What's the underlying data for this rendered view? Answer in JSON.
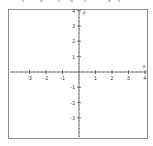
{
  "chart_data": {
    "type": "line",
    "title": "",
    "xlabel": "x",
    "ylabel": "y",
    "xlim": [
      -4,
      4
    ],
    "ylim": [
      -4,
      4
    ],
    "x_ticks": [
      -3,
      -2,
      -1,
      1,
      2,
      3,
      4
    ],
    "y_ticks": [
      4,
      3,
      2,
      1,
      -1,
      -2,
      -3
    ],
    "x_tick_labels": [
      "-3",
      "-2",
      "-1",
      "1",
      "2",
      "3",
      "4"
    ],
    "y_tick_labels": [
      "4",
      "3",
      "2",
      "1",
      "-1",
      "-2",
      "-3"
    ],
    "minor_ticks_per_unit": 4,
    "grid": false,
    "series": []
  },
  "colors": {
    "axis": "#555555",
    "frame": "#8a8a8a",
    "text": "#333333"
  }
}
